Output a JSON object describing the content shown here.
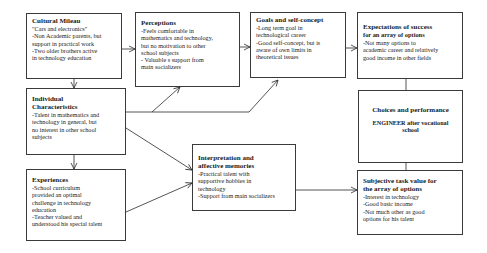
{
  "diagram": {
    "boxes": {
      "cultural_milieu": {
        "title": "Cultural Mileau",
        "lines": [
          "\"Cars and electronics\"",
          "-Non Academic parents, but",
          "support in practical work",
          "-Two older brothers active",
          "in technology education"
        ]
      },
      "perceptions": {
        "title": "Perceptions",
        "lines": [
          "-Feels comfortable in",
          "mathematics and technology,",
          "but no motivation to other",
          "school subjects",
          "- Valuable s support from",
          "main socializers"
        ]
      },
      "goals": {
        "title": "Goals and self-concept",
        "lines": [
          "-Long term goal in",
          "technological career",
          "-Good self-concept, but is",
          "aware of own limits in",
          "theoretical issues"
        ]
      },
      "expectations": {
        "title": "Expectations of success",
        "subtitle": "for an array of options",
        "lines": [
          "-Not many options to",
          "academic career and relatively",
          "good income in other fields"
        ]
      },
      "individual": {
        "title": "Individual",
        "title2": "Characteristics",
        "lines": [
          "-Talent in mathematics and",
          "technology in general, but",
          "no interest in other school",
          "subjects"
        ]
      },
      "choices": {
        "title": "Choices and performance",
        "lines": [
          "ENGINEER after vocational",
          "school"
        ]
      },
      "experiences": {
        "title": "Experiences",
        "lines": [
          "-School curriculum",
          "provided an optimal",
          "challenge in technology",
          "education",
          "-Teacher valued and",
          "understood his special talent"
        ]
      },
      "interpretation": {
        "title": "Interpretation and",
        "title2": "affective memories",
        "lines": [
          "-Practical talent with",
          "supportive hobbies in",
          "technology",
          "-Support from main socializers"
        ]
      },
      "subjective": {
        "title": "Subjective task value for",
        "title2": "the array of options",
        "lines": [
          "-Interest in technology",
          "-Good basic income",
          "-Not much other as good",
          "options for his talent"
        ]
      }
    },
    "connections": [
      {
        "from": "Cultural Mileau",
        "to": "Perceptions"
      },
      {
        "from": "Cultural Mileau",
        "to": "Individual Characteristics"
      },
      {
        "from": "Perceptions",
        "to": "Goals and self-concept"
      },
      {
        "from": "Goals and self-concept",
        "to": "Expectations of success for an array of options"
      },
      {
        "from": "Individual Characteristics",
        "to": "Perceptions"
      },
      {
        "from": "Individual Characteristics",
        "to": "Goals and self-concept"
      },
      {
        "from": "Individual Characteristics",
        "to": "Experiences"
      },
      {
        "from": "Individual Characteristics",
        "to": "Interpretation and affective memories"
      },
      {
        "from": "Experiences",
        "to": "Interpretation and affective memories"
      },
      {
        "from": "Interpretation and affective memories",
        "to": "Subjective task value for the array of options"
      },
      {
        "from": "Expectations of success for an array of options",
        "to": "Choices and performance"
      },
      {
        "from": "Subjective task value for the array of options",
        "to": "Choices and performance"
      }
    ],
    "colors": {
      "border": "#3a3a3a",
      "text": "#1a1a1a",
      "background": "#ffffff"
    }
  }
}
